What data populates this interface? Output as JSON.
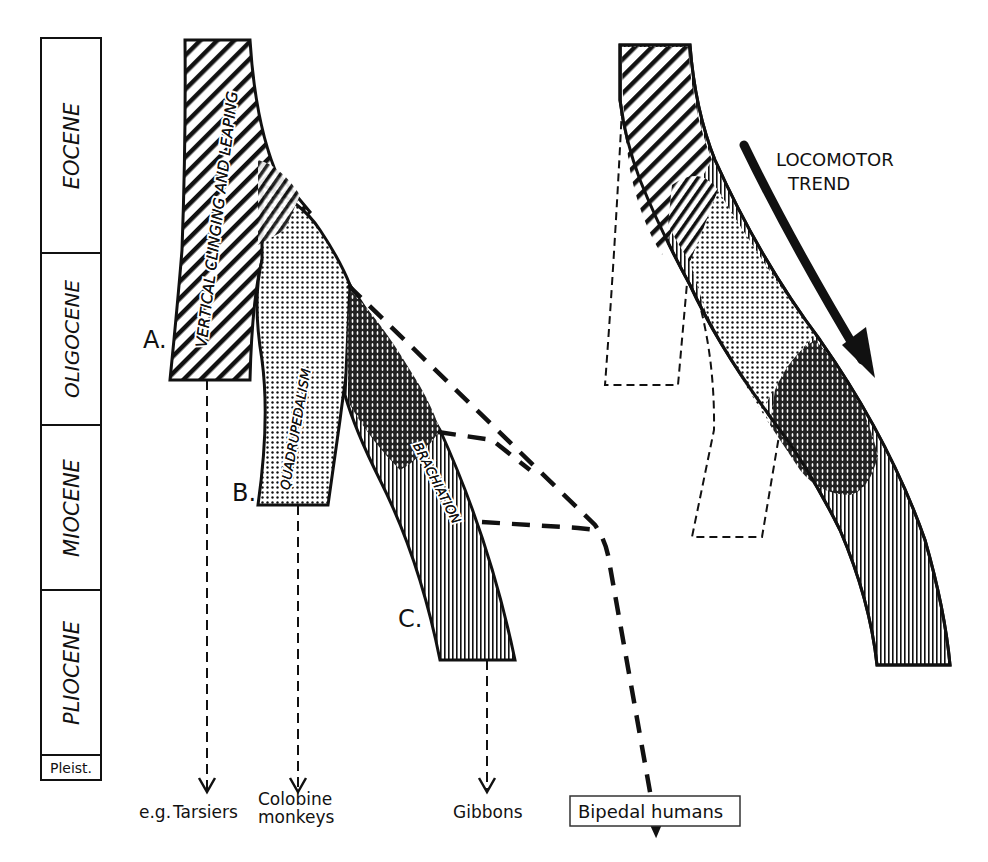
{
  "figure": {
    "kind": "phylogenetic locomotor diagram",
    "ink_color": "#111111",
    "background": "#ffffff"
  },
  "time_scale": {
    "epochs": [
      {
        "label": "EOCENE",
        "top": 38,
        "bottom": 253
      },
      {
        "label": "OLIGOCENE",
        "top": 253,
        "bottom": 425
      },
      {
        "label": "MIOCENE",
        "top": 425,
        "bottom": 590
      },
      {
        "label": "PLIOCENE",
        "top": 590,
        "bottom": 755
      },
      {
        "label": "Pleist.",
        "top": 755,
        "bottom": 780
      }
    ]
  },
  "lineages": [
    {
      "id": "A",
      "marker": "A.",
      "locomotion": "VERTICAL CLINGING AND LEAPING",
      "pattern": "diagonal-hatch",
      "descendant": "Tarsiers"
    },
    {
      "id": "B",
      "marker": "B.",
      "locomotion": "QUADRUPEDALISM",
      "pattern": "stipple",
      "descendant": "Colobine monkeys"
    },
    {
      "id": "C",
      "marker": "C.",
      "locomotion": "BRACHIATION",
      "pattern": "vertical-hatch",
      "descendant": "Gibbons"
    }
  ],
  "outcomes": {
    "prefix": "e.g.",
    "tarsiers": "Tarsiers",
    "colobine_line1": "Colobine",
    "colobine_line2": "monkeys",
    "gibbons": "Gibbons",
    "bipedal": "Bipedal humans"
  },
  "trend_panel": {
    "label_line1": "LOCOMOTOR",
    "label_line2": "TREND",
    "arrow_icon": "curved-arrow-down-right"
  }
}
